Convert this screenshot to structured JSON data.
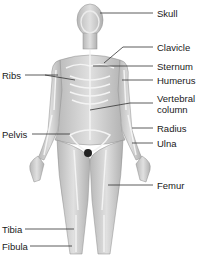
{
  "diagram": {
    "colors": {
      "body": "#cfcfcf",
      "bone": "#f2f2f2",
      "shadow": "#9a9a9a",
      "text": "#1a1a1a",
      "background": "#ffffff"
    },
    "labels_right": [
      {
        "id": "skull",
        "text": "Skull"
      },
      {
        "id": "clavicle",
        "text": "Clavicle"
      },
      {
        "id": "sternum",
        "text": "Sternum"
      },
      {
        "id": "humerus",
        "text": "Humerus"
      },
      {
        "id": "vertebral",
        "text": "Vertebral"
      },
      {
        "id": "column",
        "text": "column"
      },
      {
        "id": "radius",
        "text": "Radius"
      },
      {
        "id": "ulna",
        "text": "Ulna"
      },
      {
        "id": "femur",
        "text": "Femur"
      }
    ],
    "labels_left": [
      {
        "id": "ribs",
        "text": "Ribs"
      },
      {
        "id": "pelvis",
        "text": "Pelvis"
      },
      {
        "id": "tibia",
        "text": "Tibia"
      },
      {
        "id": "fibula",
        "text": "Fibula"
      }
    ]
  }
}
